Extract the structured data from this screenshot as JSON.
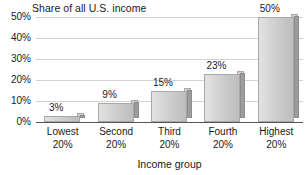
{
  "chart_data": {
    "type": "bar",
    "title": "Share of all U.S. income",
    "xlabel": "Income group",
    "ylabel": "",
    "categories": [
      "Lowest 20%",
      "Second 20%",
      "Third 20%",
      "Fourth 20%",
      "Highest 20%"
    ],
    "category_lines": [
      {
        "line1": "Lowest",
        "line2": "20%"
      },
      {
        "line1": "Second",
        "line2": "20%"
      },
      {
        "line1": "Third",
        "line2": "20%"
      },
      {
        "line1": "Fourth",
        "line2": "20%"
      },
      {
        "line1": "Highest",
        "line2": "20%"
      }
    ],
    "values": [
      3,
      9,
      15,
      23,
      50
    ],
    "data_labels": [
      "3%",
      "9%",
      "15%",
      "23%",
      "50%"
    ],
    "ylim": [
      0,
      50
    ],
    "ytick_values": [
      0,
      10,
      20,
      30,
      40,
      50
    ],
    "ytick_labels": [
      "0%",
      "10%",
      "20%",
      "30%",
      "40%",
      "50%"
    ],
    "grid": true,
    "legend": "none",
    "style": "3d-bar",
    "colors": {
      "bar_face_light": "#e3e3e3",
      "bar_face_dark": "#bdbdbd",
      "bar_side": "#9d9d9d",
      "bar_outline": "#a8a8a8",
      "gridline": "#d2d2d2",
      "axis": "#555555",
      "text": "#1a1a1a",
      "background": "#ffffff"
    }
  }
}
